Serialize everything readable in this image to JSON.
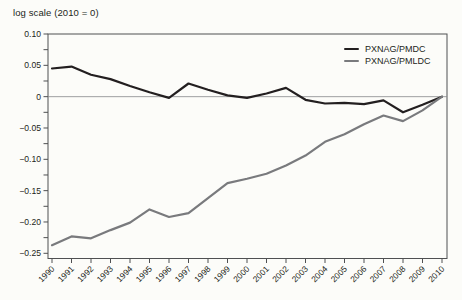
{
  "title": "log scale (2010 = 0)",
  "legend": {
    "items": [
      {
        "label": "PXNAG/PMDC"
      },
      {
        "label": "PXNAG/PMLDC"
      }
    ]
  },
  "colors": {
    "series1": "#231f20",
    "series2": "#797a7d",
    "axis": "#4f5052",
    "zero_line": "#87888b",
    "text": "#231f20",
    "background": "#fcfcf9"
  },
  "chart_data": {
    "type": "line",
    "title": "log scale (2010 = 0)",
    "x": [
      1990,
      1991,
      1992,
      1993,
      1994,
      1995,
      1996,
      1997,
      1998,
      1999,
      2000,
      2001,
      2002,
      2003,
      2004,
      2005,
      2006,
      2007,
      2008,
      2009,
      2010
    ],
    "series": [
      {
        "name": "PXNAG/PMDC",
        "color": "#231f20",
        "values": [
          0.045,
          0.048,
          0.035,
          0.028,
          0.017,
          0.007,
          -0.002,
          0.021,
          0.011,
          0.002,
          -0.002,
          0.005,
          0.014,
          -0.005,
          -0.011,
          -0.01,
          -0.012,
          -0.006,
          -0.025,
          -0.013,
          0.0
        ]
      },
      {
        "name": "PXNAG/PMLDC",
        "color": "#797a7d",
        "values": [
          -0.237,
          -0.223,
          -0.226,
          -0.213,
          -0.201,
          -0.18,
          -0.192,
          -0.186,
          -0.162,
          -0.138,
          -0.131,
          -0.123,
          -0.11,
          -0.094,
          -0.072,
          -0.06,
          -0.044,
          -0.03,
          -0.039,
          -0.022,
          0.0
        ]
      }
    ],
    "ylim": [
      -0.25,
      0.1
    ],
    "yticks": [
      0.1,
      0.05,
      0,
      -0.05,
      -0.1,
      -0.15,
      -0.2,
      -0.25
    ],
    "ytick_labels": [
      "0.10",
      "0.05",
      "0",
      "−0.05",
      "−0.10",
      "−0.15",
      "−0.20",
      "−0.25"
    ],
    "y_minor_tick_step": 0.025,
    "xtick_labels": [
      "1990",
      "1991",
      "1992",
      "1993",
      "1994",
      "1995",
      "1996",
      "1997",
      "1998",
      "1999",
      "2000",
      "2001",
      "2002",
      "2003",
      "2004",
      "2005",
      "2006",
      "2007",
      "2008",
      "2009",
      "2010"
    ],
    "grid": false,
    "legend_position": "top-right",
    "zero_line": true
  }
}
